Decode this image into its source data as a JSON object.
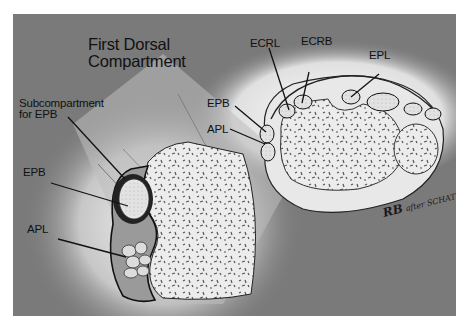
{
  "figure": {
    "title_line1": "First Dorsal",
    "title_line2": "Compartment",
    "colors": {
      "background_panel": "#7a7a7a",
      "bone": "#e6e6e6",
      "tendon": "#d9d9d9",
      "outline": "#1a1a1a",
      "page": "#ffffff"
    }
  },
  "left_view": {
    "labels": {
      "subcompartment_line1": "Subcompartment",
      "subcompartment_line2": "for EPB",
      "epb": "EPB",
      "apl": "APL"
    }
  },
  "right_view": {
    "labels": {
      "ecrl": "ECRL",
      "ecrb": "ECRB",
      "epl": "EPL",
      "epb": "EPB",
      "apl": "APL"
    }
  },
  "signature": {
    "mark": "RB",
    "text": "after SCHATZ"
  }
}
